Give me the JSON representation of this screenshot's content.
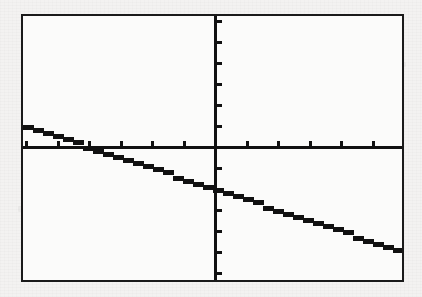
{
  "screen": {
    "device_label": "graphing-calculator-screen",
    "border_color": "#1a1a1a",
    "screen_background": "#fbfbfa",
    "page_background": "#f3f2f1"
  },
  "chart_data": {
    "type": "line",
    "title": "",
    "subtitle": "",
    "xlabel": "",
    "ylabel": "",
    "legend": [],
    "legend_position": "none",
    "grid": false,
    "axes_visible": true,
    "tick_marks_visible": true,
    "xlim": [
      -6.1,
      6.1
    ],
    "ylim": [
      -6.4,
      6.4
    ],
    "xticks": [
      -6,
      -5,
      -4,
      -3,
      -2,
      -1,
      1,
      2,
      3,
      4,
      5,
      6
    ],
    "yticks": [
      -6,
      -5,
      -4,
      -3,
      -2,
      -1,
      1,
      2,
      3,
      4,
      5,
      6
    ],
    "xtick_labels": [],
    "ytick_labels": [],
    "x_tick_spacing": 1,
    "y_tick_spacing": 1,
    "series": [
      {
        "name": "y = -0.5x - 2",
        "type": "line",
        "slope": -0.5,
        "intercept": -2,
        "x_intercept": -4,
        "y_intercept": -2,
        "color": "#111111",
        "line_style": "solid",
        "pixelated": true,
        "x": [
          -6.1,
          6.1
        ],
        "y": [
          1.05,
          -5.05
        ]
      }
    ],
    "annotations": []
  },
  "geometry": {
    "origin_x_px": 192,
    "origin_y_px": 131,
    "x_unit_px": 31.5,
    "y_unit_px": 21.0,
    "tick_length_px": 5,
    "axis_width_px": 3,
    "curve_width_px": 5,
    "step_width_px": 10
  }
}
